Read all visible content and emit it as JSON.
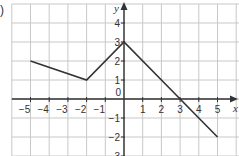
{
  "part_label": ")",
  "chart_data": {
    "type": "line",
    "title": "",
    "xlabel": "x",
    "ylabel": "y",
    "x": [
      -5,
      -2,
      0,
      3,
      5
    ],
    "y": [
      2,
      1,
      3,
      0,
      -2
    ],
    "series": [
      {
        "name": "piecewise linear graph",
        "points": [
          [
            -5,
            2
          ],
          [
            -2,
            1
          ],
          [
            0,
            3
          ],
          [
            3,
            0
          ],
          [
            5,
            -2
          ]
        ]
      }
    ],
    "x_ticks": [
      -5,
      -4,
      -3,
      -2,
      -1,
      1,
      2,
      3,
      4,
      5
    ],
    "y_ticks": [
      4,
      3,
      2,
      1,
      -1,
      -2,
      -3
    ],
    "origin_label": "0",
    "xlim": [
      -6,
      6
    ],
    "ylim": [
      -3,
      5
    ],
    "grid": true,
    "legend": null,
    "colors": {
      "line": "#333333",
      "grid": "#c8c8c8",
      "axis": "#333333",
      "text": "#333333"
    }
  }
}
